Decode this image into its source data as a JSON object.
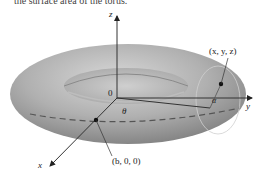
{
  "caption": {
    "text": "the surface area of the torus."
  },
  "figure": {
    "type": "torus",
    "colors": {
      "torus_fill": "#9a9a9a",
      "torus_highlight": "#d4d4d4",
      "axis": "#333333",
      "background": "#ffffff"
    },
    "axes": {
      "x": "x",
      "y": "y",
      "z": "z"
    },
    "origin_label": "0",
    "angles": {
      "theta": "θ",
      "alpha": "α"
    },
    "points": {
      "surface_point": "(x, y, z)",
      "center_point": "(b, 0, 0)"
    }
  }
}
